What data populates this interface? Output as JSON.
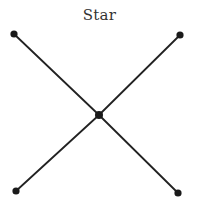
{
  "diagram": {
    "title": "Star",
    "type": "network-topology",
    "colors": {
      "line": "#222222",
      "node": "#1a1a1a",
      "title": "#333333",
      "background": "#ffffff"
    },
    "nodes": [
      {
        "id": "top-left",
        "x": 14,
        "y": 34
      },
      {
        "id": "top-right",
        "x": 180,
        "y": 35
      },
      {
        "id": "center",
        "x": 99,
        "y": 115,
        "hub": true
      },
      {
        "id": "bottom-left",
        "x": 16,
        "y": 191
      },
      {
        "id": "bottom-right",
        "x": 178,
        "y": 193
      }
    ],
    "edges": [
      {
        "from": "top-left",
        "to": "center"
      },
      {
        "from": "top-right",
        "to": "center"
      },
      {
        "from": "center",
        "to": "bottom-left"
      },
      {
        "from": "center",
        "to": "bottom-right"
      }
    ]
  }
}
